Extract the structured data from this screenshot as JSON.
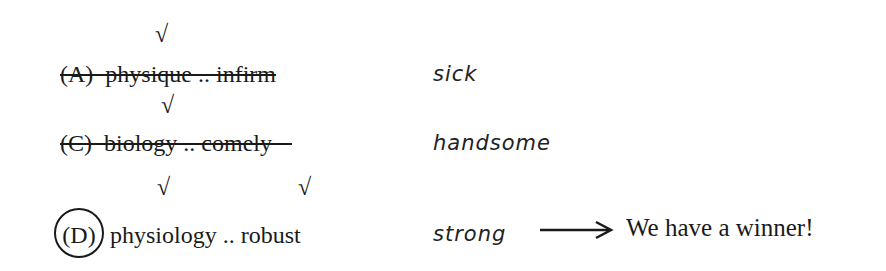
{
  "rows": [
    {
      "label": "(A)",
      "word1": "physique",
      "sep": "..",
      "word2": "infirm",
      "struck": true,
      "circled": false,
      "checks": [
        "word1"
      ],
      "note": "sick"
    },
    {
      "label": "(C)",
      "word1": "biology",
      "sep": "..",
      "word2": "comely",
      "struck": true,
      "circled": false,
      "checks": [
        "word1"
      ],
      "note": "handsome"
    },
    {
      "label": "(D)",
      "word1": "physiology",
      "sep": "..",
      "word2": "robust",
      "struck": false,
      "circled": true,
      "checks": [
        "word1",
        "word2"
      ],
      "note": "strong"
    }
  ],
  "check_glyph": "√",
  "arrow_glyph": "⟶",
  "conclusion": "We have a winner!"
}
